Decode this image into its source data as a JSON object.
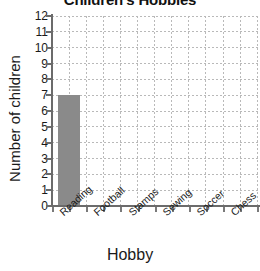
{
  "chart_data": {
    "type": "bar",
    "title": "Children's Hobbies",
    "xlabel": "Hobby",
    "ylabel": "Number of children",
    "categories": [
      "Reading",
      "Football",
      "Stamps",
      "Sewing",
      "Soccer",
      "Chess"
    ],
    "values": [
      7,
      0,
      0,
      0,
      0,
      0
    ],
    "ylim": [
      0,
      12
    ],
    "ytick_labels": [
      "0",
      "1",
      "2",
      "3",
      "4",
      "5",
      "6",
      "7",
      "8",
      "9",
      "10",
      "11",
      "12"
    ],
    "ytick_step": 1,
    "grid": true,
    "grid_style": "dotted",
    "legend": null,
    "bar_color": "#8a8a8a",
    "axis_color": "#6b6b6b",
    "grid_color": "#b9b9b9",
    "title_clipped": true
  }
}
